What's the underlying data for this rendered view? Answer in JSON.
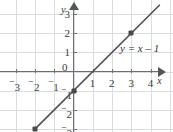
{
  "chart_data": {
    "type": "line",
    "title": "",
    "xlabel": "x",
    "ylabel": "y",
    "equation_label": "y = x – 1",
    "xlim": [
      -3.8,
      4.6
    ],
    "ylim": [
      -3.6,
      3.8
    ],
    "grid": true,
    "legend_position": "none",
    "x_ticks": [
      {
        "value": -3,
        "label": "3",
        "negative": true
      },
      {
        "value": -2,
        "label": "2",
        "negative": true
      },
      {
        "value": -1,
        "label": "1",
        "negative": true
      },
      {
        "value": 1,
        "label": "1",
        "negative": false
      },
      {
        "value": 2,
        "label": "2",
        "negative": false
      },
      {
        "value": 3,
        "label": "3",
        "negative": false
      },
      {
        "value": 4,
        "label": "4",
        "negative": false
      }
    ],
    "y_ticks": [
      {
        "value": 3,
        "label": "3",
        "negative": false
      },
      {
        "value": 2,
        "label": "2",
        "negative": false
      },
      {
        "value": 1,
        "label": "1",
        "negative": false
      },
      {
        "value": -1,
        "label": "1",
        "negative": true
      },
      {
        "value": -2,
        "label": "2",
        "negative": true
      },
      {
        "value": -3,
        "label": "3",
        "negative": true
      }
    ],
    "origin_label": "0",
    "series": [
      {
        "name": "y = x – 1",
        "slope": 1,
        "intercept": -1,
        "x_start": -2.0,
        "x_end": 4.45,
        "color": "#555555",
        "points": [
          {
            "x": -2,
            "y": -3
          },
          {
            "x": 0,
            "y": -1
          },
          {
            "x": 3,
            "y": 2
          }
        ]
      }
    ],
    "colors": {
      "grid": "#d8dde2",
      "axis": "#6e6e6e",
      "line": "#555555",
      "point": "#4a4a4a",
      "text": "#3a3a3a",
      "background": "#ffffff"
    }
  }
}
